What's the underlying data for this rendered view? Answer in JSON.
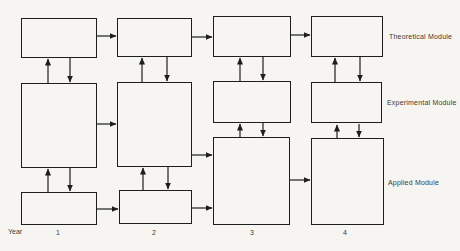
{
  "diagram": {
    "background_color": "#f6f5f1",
    "line_color": "#1e1e1e",
    "text_color": "#3a3a3a",
    "module_labels": [
      {
        "id": "theoretical",
        "text": "Theoretical Module",
        "x": 389,
        "y": 33
      },
      {
        "id": "experimental",
        "text": "Experimental Module",
        "x": 387,
        "y": 99
      },
      {
        "id": "applied",
        "text": "Applied Module",
        "x": 388,
        "y": 179
      }
    ],
    "year_axis": {
      "label": {
        "text": "Year",
        "x": 8,
        "y": 228
      },
      "ticks": [
        {
          "text": "1",
          "x": 56,
          "y": 229
        },
        {
          "text": "2",
          "x": 152,
          "y": 229
        },
        {
          "text": "3",
          "x": 250,
          "y": 229
        },
        {
          "text": "4",
          "x": 343,
          "y": 229
        }
      ]
    },
    "boxes": [
      {
        "id": "theoretical-y1",
        "x": 21,
        "y": 18,
        "w": 76,
        "h": 40
      },
      {
        "id": "theoretical-y2",
        "x": 117,
        "y": 18,
        "w": 75,
        "h": 39
      },
      {
        "id": "theoretical-y3",
        "x": 213,
        "y": 16,
        "w": 78,
        "h": 41
      },
      {
        "id": "theoretical-y4",
        "x": 311,
        "y": 16,
        "w": 72,
        "h": 41
      },
      {
        "id": "experimental-y1",
        "x": 21,
        "y": 83,
        "w": 76,
        "h": 85
      },
      {
        "id": "experimental-y2",
        "x": 117,
        "y": 82,
        "w": 75,
        "h": 85
      },
      {
        "id": "experimental-y3",
        "x": 213,
        "y": 81,
        "w": 78,
        "h": 42
      },
      {
        "id": "experimental-y4",
        "x": 311,
        "y": 82,
        "w": 71,
        "h": 41
      },
      {
        "id": "applied-y1",
        "x": 21,
        "y": 192,
        "w": 76,
        "h": 33
      },
      {
        "id": "applied-y2",
        "x": 119,
        "y": 190,
        "w": 73,
        "h": 34
      },
      {
        "id": "applied-y3",
        "x": 213,
        "y": 137,
        "w": 77,
        "h": 88
      },
      {
        "id": "applied-y4",
        "x": 311,
        "y": 138,
        "w": 73,
        "h": 87
      }
    ],
    "arrows": [
      {
        "name": "arrow-theoretical-y1-y2",
        "x1": 97,
        "y1": 36,
        "x2": 116,
        "y2": 36
      },
      {
        "name": "arrow-theoretical-y2-y3",
        "x1": 192,
        "y1": 37,
        "x2": 212,
        "y2": 37
      },
      {
        "name": "arrow-theoretical-y3-y4",
        "x1": 291,
        "y1": 35,
        "x2": 310,
        "y2": 35
      },
      {
        "name": "arrow-experimental-y1-y2",
        "x1": 97,
        "y1": 124,
        "x2": 116,
        "y2": 124
      },
      {
        "name": "arrow-experimental-y2-to-applied-y3",
        "x1": 192,
        "y1": 155,
        "x2": 212,
        "y2": 155
      },
      {
        "name": "arrow-applied-y1-y2",
        "x1": 97,
        "y1": 209,
        "x2": 118,
        "y2": 209
      },
      {
        "name": "arrow-applied-y2-y3",
        "x1": 192,
        "y1": 208,
        "x2": 212,
        "y2": 208
      },
      {
        "name": "arrow-applied-y3-y4",
        "x1": 290,
        "y1": 180,
        "x2": 310,
        "y2": 180
      },
      {
        "name": "arrow-up-experimental-theoretical-y1",
        "x1": 48,
        "y1": 83,
        "x2": 48,
        "y2": 59
      },
      {
        "name": "arrow-down-theoretical-experimental-y1",
        "x1": 70,
        "y1": 58,
        "x2": 70,
        "y2": 82
      },
      {
        "name": "arrow-up-applied-experimental-y1",
        "x1": 48,
        "y1": 192,
        "x2": 48,
        "y2": 169
      },
      {
        "name": "arrow-down-experimental-applied-y1",
        "x1": 70,
        "y1": 168,
        "x2": 70,
        "y2": 191
      },
      {
        "name": "arrow-up-experimental-theoretical-y2",
        "x1": 142,
        "y1": 82,
        "x2": 142,
        "y2": 58
      },
      {
        "name": "arrow-down-theoretical-experimental-y2",
        "x1": 167,
        "y1": 57,
        "x2": 167,
        "y2": 81
      },
      {
        "name": "arrow-up-applied-experimental-y2",
        "x1": 143,
        "y1": 190,
        "x2": 143,
        "y2": 168
      },
      {
        "name": "arrow-down-experimental-applied-y2",
        "x1": 168,
        "y1": 167,
        "x2": 168,
        "y2": 189
      },
      {
        "name": "arrow-up-experimental-theoretical-y3",
        "x1": 240,
        "y1": 81,
        "x2": 240,
        "y2": 58
      },
      {
        "name": "arrow-down-theoretical-experimental-y3",
        "x1": 263,
        "y1": 57,
        "x2": 263,
        "y2": 80
      },
      {
        "name": "arrow-up-applied-experimental-y3",
        "x1": 240,
        "y1": 137,
        "x2": 240,
        "y2": 124
      },
      {
        "name": "arrow-down-experimental-applied-y3",
        "x1": 263,
        "y1": 123,
        "x2": 263,
        "y2": 136
      },
      {
        "name": "arrow-up-experimental-theoretical-y4",
        "x1": 335,
        "y1": 82,
        "x2": 335,
        "y2": 58
      },
      {
        "name": "arrow-down-theoretical-experimental-y4",
        "x1": 360,
        "y1": 57,
        "x2": 360,
        "y2": 81
      },
      {
        "name": "arrow-up-applied-experimental-y4",
        "x1": 337,
        "y1": 138,
        "x2": 337,
        "y2": 125
      },
      {
        "name": "arrow-down-experimental-applied-y4",
        "x1": 359,
        "y1": 124,
        "x2": 359,
        "y2": 137
      }
    ]
  }
}
